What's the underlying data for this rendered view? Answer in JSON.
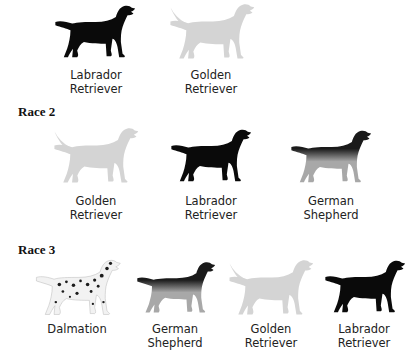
{
  "colors": {
    "labrador": "#0a0a0a",
    "golden": "#d4d4d4",
    "golden_shade": "#bdbdbd",
    "shepherd_light": "#a8a8a8",
    "shepherd_dark": "#1a1a1a",
    "dalmatian_base": "#f2f2f2",
    "dalmatian_spot": "#1c1c1c"
  },
  "race1": {
    "heading": "",
    "dogs": [
      {
        "breed": "labrador",
        "icon": "labrador-retriever-icon",
        "label_line1": "Labrador",
        "label_line2": "Retriever"
      },
      {
        "breed": "golden",
        "icon": "golden-retriever-icon",
        "label_line1": "Golden",
        "label_line2": "Retriever"
      }
    ]
  },
  "race2": {
    "heading": "Race 2",
    "dogs": [
      {
        "breed": "golden",
        "icon": "golden-retriever-icon",
        "label_line1": "Golden",
        "label_line2": "Retriever"
      },
      {
        "breed": "labrador",
        "icon": "labrador-retriever-icon",
        "label_line1": "Labrador",
        "label_line2": "Retriever"
      },
      {
        "breed": "shepherd",
        "icon": "german-shepherd-icon",
        "label_line1": "German",
        "label_line2": "Shepherd"
      }
    ]
  },
  "race3": {
    "heading": "Race 3",
    "dogs": [
      {
        "breed": "dalmatian",
        "icon": "dalmatian-icon",
        "label_line1": "Dalmation",
        "label_line2": ""
      },
      {
        "breed": "shepherd",
        "icon": "german-shepherd-icon",
        "label_line1": "German",
        "label_line2": "Shepherd"
      },
      {
        "breed": "golden",
        "icon": "golden-retriever-icon",
        "label_line1": "Golden",
        "label_line2": "Retriever"
      },
      {
        "breed": "labrador",
        "icon": "labrador-retriever-icon",
        "label_line1": "Labrador",
        "label_line2": "Retriever"
      }
    ]
  }
}
